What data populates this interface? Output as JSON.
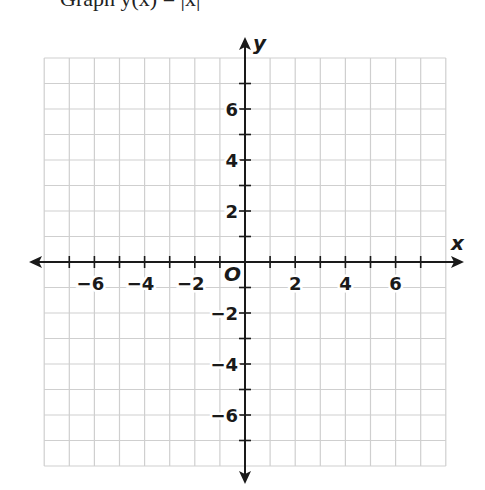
{
  "header": {
    "text": "Graph y(x) = |x|"
  },
  "chart_data": {
    "type": "line",
    "title": "",
    "xlabel": "x",
    "ylabel": "y",
    "origin_label": "O",
    "xlim": [
      -8,
      8
    ],
    "ylim": [
      -8,
      8
    ],
    "grid": true,
    "grid_step": 1,
    "x_ticks": [
      -7,
      -6,
      -5,
      -4,
      -3,
      -2,
      -1,
      1,
      2,
      3,
      4,
      5,
      6,
      7
    ],
    "y_ticks": [
      -7,
      -6,
      -5,
      -4,
      -3,
      -2,
      -1,
      1,
      2,
      3,
      4,
      5,
      6,
      7
    ],
    "x_tick_labels": [
      "−6",
      "−4",
      "−2",
      "2",
      "4",
      "6"
    ],
    "x_tick_label_values": [
      -6,
      -4,
      -2,
      2,
      4,
      6
    ],
    "y_tick_labels": [
      "6",
      "4",
      "2",
      "−2",
      "−4",
      "−6"
    ],
    "y_tick_label_values": [
      6,
      4,
      2,
      -2,
      -4,
      -6
    ],
    "series": [],
    "legend": null
  },
  "colors": {
    "grid": "#cfcfcf",
    "axis": "#1a1a1a",
    "background": "#ffffff"
  }
}
